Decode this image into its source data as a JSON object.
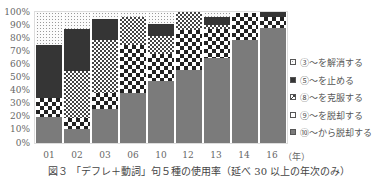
{
  "chart_data": {
    "type": "bar",
    "stacked": true,
    "title": "",
    "xlabel": "（年）",
    "ylabel": "",
    "ylim": [
      0,
      100
    ],
    "yticks": [
      "0%",
      "10%",
      "20%",
      "30%",
      "40%",
      "50%",
      "60%",
      "70%",
      "80%",
      "90%",
      "100%"
    ],
    "categories": [
      "01",
      "02",
      "03",
      "06",
      "10",
      "12",
      "13",
      "14",
      "16"
    ],
    "series": [
      {
        "name": "⑩～から脱却する",
        "pattern": "gray",
        "values": [
          20,
          11,
          26,
          38,
          47,
          56,
          65,
          79,
          88
        ]
      },
      {
        "name": "⑨～を脱却する",
        "pattern": "big-checker",
        "values": [
          14,
          8,
          12,
          37,
          21,
          30,
          22,
          20,
          8
        ]
      },
      {
        "name": "⑧～を克服する",
        "pattern": "small-checker",
        "values": [
          0,
          36,
          41,
          21,
          14,
          14,
          3,
          0,
          0
        ]
      },
      {
        "name": "⑤～を止める",
        "pattern": "black",
        "values": [
          41,
          32,
          16,
          0,
          9,
          0,
          6,
          0,
          4
        ]
      },
      {
        "name": "③～を解消する",
        "pattern": "dotted",
        "values": [
          25,
          13,
          5,
          4,
          9,
          0,
          4,
          1,
          0
        ]
      }
    ],
    "legend_position": "right",
    "grid": false,
    "caption": "図３ 「デフレ＋動詞」句５種の使用率（延べ 30 以上の年次のみ）"
  },
  "axis": {
    "y": [
      "100%",
      "90%",
      "80%",
      "70%",
      "60%",
      "50%",
      "40%",
      "30%",
      "20%",
      "10%",
      "0%"
    ],
    "x": [
      "01",
      "02",
      "03",
      "06",
      "10",
      "12",
      "13",
      "14",
      "16"
    ],
    "x_unit": "（年）"
  },
  "legend": [
    {
      "label": "③～を解消する"
    },
    {
      "label": "⑤～を止める"
    },
    {
      "label": "⑧～を克服する"
    },
    {
      "label": "⑨～を脱却する"
    },
    {
      "label": "⑩～から脱却する"
    }
  ],
  "caption": "図３ 「デフレ＋動詞」句５種の使用率（延べ 30 以上の年次のみ）"
}
